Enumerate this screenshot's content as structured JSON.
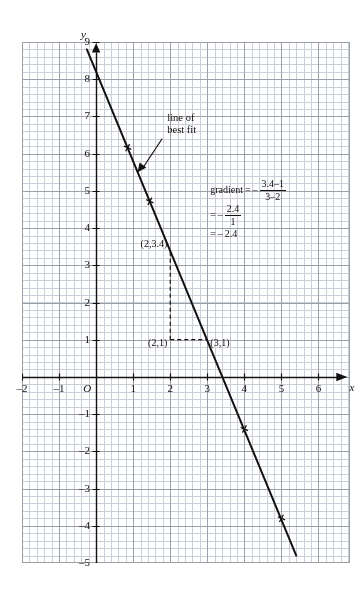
{
  "page": {
    "cropped_header_text": "",
    "background": "#ffffff",
    "ink": "#111111",
    "grid_major_color": "#9aa0a8",
    "grid_minor_color": "#c9cfd6"
  },
  "chart_data": {
    "type": "line",
    "title": "",
    "xlabel": "x",
    "ylabel": "y",
    "xlim": [
      -2.0,
      6.85
    ],
    "ylim": [
      -5.0,
      9.0
    ],
    "xticks": [
      -2,
      -1,
      0,
      1,
      2,
      3,
      4,
      5,
      6
    ],
    "xtick_labels": [
      "–2",
      "–1",
      "O",
      "1",
      "2",
      "3",
      "4",
      "5",
      "6"
    ],
    "yticks": [
      -5,
      -4,
      -3,
      -2,
      -1,
      1,
      2,
      3,
      4,
      5,
      6,
      7,
      8,
      9
    ],
    "ytick_labels": [
      "–5",
      "–4",
      "–3",
      "–2",
      "–1",
      "1",
      "2",
      "3",
      "4",
      "5",
      "6",
      "7",
      "8",
      "9"
    ],
    "grid": true,
    "grid_minor_divisions": 5,
    "origin_label": "O",
    "series": [
      {
        "name": "line of best fit",
        "type": "line",
        "x": [
          -0.25,
          5.4
        ],
        "y": [
          8.8,
          -4.8
        ],
        "slope": -2.4,
        "intercept": 8.2,
        "marker": "cross",
        "marker_points": [
          {
            "x": 0.85,
            "y": 6.16
          },
          {
            "x": 1.45,
            "y": 4.72
          },
          {
            "x": 4.0,
            "y": -1.4
          },
          {
            "x": 5.0,
            "y": -3.8
          }
        ]
      }
    ],
    "reference_lines": [
      {
        "name": "vertical-dashed-x2",
        "from": {
          "x": 2,
          "y": 1
        },
        "to": {
          "x": 2,
          "y": 3.4
        },
        "style": "dashed"
      },
      {
        "name": "horizontal-dashed-y1",
        "from": {
          "x": 2,
          "y": 1
        },
        "to": {
          "x": 3,
          "y": 1
        },
        "style": "dashed"
      }
    ],
    "point_labels": [
      {
        "text": "(2,3.4)",
        "x": 2,
        "y": 3.4,
        "anchor": "left"
      },
      {
        "text": "(2,1)",
        "x": 2,
        "y": 1,
        "anchor": "left"
      },
      {
        "text": "(3,1)",
        "x": 3,
        "y": 1,
        "anchor": "right"
      }
    ],
    "annotations": [
      {
        "name": "line-of-best-fit-callout",
        "line1": "line of",
        "line2": "best fit",
        "arrow_from": {
          "x": 1.78,
          "y": 6.4
        },
        "arrow_to": {
          "x": 1.12,
          "y": 5.5
        }
      }
    ]
  },
  "gradient_box": {
    "label": "gradient",
    "equals": "=",
    "sign": "–",
    "line1": {
      "numerator": "3.4–1",
      "denominator": "3–2"
    },
    "line2": {
      "numerator": "2.4",
      "denominator": "1"
    },
    "line3": {
      "value": "2.4"
    }
  }
}
